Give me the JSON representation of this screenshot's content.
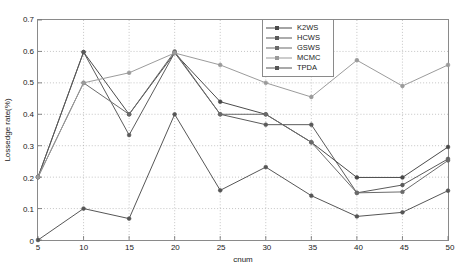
{
  "chart_data": {
    "type": "line",
    "title": "",
    "xlabel": "cnum",
    "ylabel": "Lossedge rate(%)",
    "x": [
      5,
      10,
      15,
      20,
      25,
      30,
      35,
      40,
      45,
      50
    ],
    "xlim": [
      5,
      50
    ],
    "ylim": [
      0,
      0.7
    ],
    "xticks": [
      "5",
      "10",
      "15",
      "20",
      "25",
      "30",
      "35",
      "40",
      "45",
      "50"
    ],
    "yticks": [
      "0",
      "0.1",
      "0.2",
      "0.3",
      "0.4",
      "0.5",
      "0.6",
      "0.7"
    ],
    "grid": true,
    "grid_style": "dotted",
    "legend_position": "top-right",
    "series": [
      {
        "name": "K2WS",
        "color": "#4a4a4a",
        "marker": "circle",
        "values": [
          0.2,
          0.598,
          0.4,
          0.595,
          0.44,
          0.4,
          0.311,
          0.199,
          0.199,
          0.296
        ]
      },
      {
        "name": "HCWS",
        "color": "#5a5a5a",
        "marker": "circle",
        "values": [
          0.2,
          0.598,
          0.334,
          0.596,
          0.4,
          0.367,
          0.367,
          0.15,
          0.175,
          0.258
        ]
      },
      {
        "name": "GSWS",
        "color": "#6a6a6a",
        "marker": "circle",
        "values": [
          0.2,
          0.5,
          0.4,
          0.6,
          0.4,
          0.4,
          0.311,
          0.15,
          0.153,
          0.253
        ]
      },
      {
        "name": "MCMC",
        "color": "#9a9a9a",
        "marker": "circle",
        "values": [
          0.2,
          0.5,
          0.532,
          0.595,
          0.557,
          0.5,
          0.455,
          0.572,
          0.49,
          0.557
        ]
      },
      {
        "name": "TPDA",
        "color": "#555555",
        "marker": "circle",
        "values": [
          0.0,
          0.1,
          0.068,
          0.4,
          0.158,
          0.232,
          0.141,
          0.075,
          0.088,
          0.157
        ]
      }
    ]
  }
}
